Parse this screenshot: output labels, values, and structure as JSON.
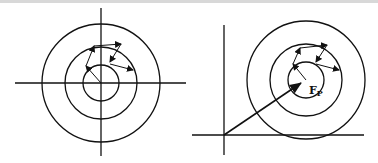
{
  "diagram": {
    "left_panel": {
      "description": "Concentric circles centered at origin of crossed axes with a chain of arrows",
      "center": [
        101,
        83
      ],
      "radii": [
        18,
        36,
        59
      ]
    },
    "right_panel": {
      "description": "Concentric circles offset from origin with position vector to center",
      "center": [
        306,
        80
      ],
      "radii": [
        18,
        36,
        59
      ],
      "vector_label": "F",
      "vector_label_sub": "P"
    }
  }
}
